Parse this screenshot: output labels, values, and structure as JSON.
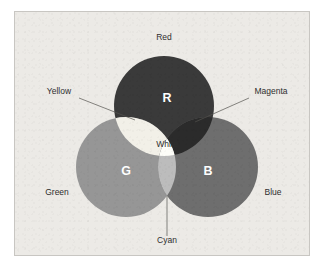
{
  "figure": {
    "panel_background": "#eceae6",
    "panel_border": "#c8c6c2",
    "page_background": "#ffffff"
  },
  "primaries": [
    {
      "key": "red",
      "letter": "R",
      "label": "Red",
      "color": "#3a3a3a",
      "letter_color": "#ffffff",
      "cx": 149,
      "cy": 94,
      "r": 50
    },
    {
      "key": "green",
      "letter": "G",
      "label": "Green",
      "color": "#969696",
      "letter_color": "#ffffff",
      "cx": 111,
      "cy": 155,
      "r": 50
    },
    {
      "key": "blue",
      "letter": "B",
      "label": "Blue",
      "color": "#6e6e6e",
      "letter_color": "#ffffff",
      "cx": 193,
      "cy": 155,
      "r": 50
    }
  ],
  "secondaries": [
    {
      "key": "yellow",
      "label": "Yellow",
      "color": "#f2f0e8",
      "sources": "red + green"
    },
    {
      "key": "magenta",
      "label": "Magenta",
      "color": "#2b2b2b",
      "sources": "red + blue"
    },
    {
      "key": "cyan",
      "label": "Cyan",
      "color": "#bcbcbc",
      "sources": "green + blue"
    }
  ],
  "center": {
    "key": "white",
    "label": "White",
    "color": "#fdfdf8",
    "label_color": "#1f1f1f",
    "sources": "red + green + blue"
  },
  "labels": {
    "red": {
      "text": "Red",
      "x": 149,
      "y": 28,
      "anchor": "middle"
    },
    "yellow": {
      "text": "Yellow",
      "x": 44,
      "y": 82,
      "anchor": "middle"
    },
    "magenta": {
      "text": "Magenta",
      "x": 256,
      "y": 82,
      "anchor": "middle"
    },
    "white": {
      "text": "White",
      "x": 152,
      "y": 135,
      "anchor": "middle"
    },
    "green": {
      "text": "Green",
      "x": 42,
      "y": 183,
      "anchor": "middle"
    },
    "blue": {
      "text": "Blue",
      "x": 258,
      "y": 183,
      "anchor": "middle"
    },
    "cyan": {
      "text": "Cyan",
      "x": 152,
      "y": 231,
      "anchor": "middle"
    }
  },
  "letters": {
    "r": {
      "text": "R",
      "x": 152,
      "y": 90
    },
    "g": {
      "text": "G",
      "x": 111,
      "y": 163
    },
    "b": {
      "text": "B",
      "x": 193,
      "y": 163
    }
  },
  "leaders": [
    {
      "key": "yellow-leader",
      "x1": 64,
      "y1": 86,
      "x2": 120,
      "y2": 108
    },
    {
      "key": "magenta-leader",
      "x1": 234,
      "y1": 86,
      "x2": 180,
      "y2": 110
    },
    {
      "key": "cyan-leader",
      "x1": 152,
      "y1": 224,
      "x2": 152,
      "y2": 184
    }
  ]
}
